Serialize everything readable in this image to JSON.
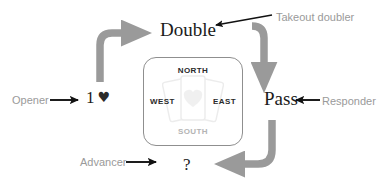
{
  "diagram": {
    "colors": {
      "flow_arrow": "#9a9a9a",
      "pointer_arrow": "#111111",
      "role_label": "#9a9a9a",
      "call_text": "#1b1b1b",
      "compass_border": "#8f8f8f",
      "south_label": "#b4b4b4",
      "background": "#ffffff"
    }
  },
  "calls": {
    "opener_bid": "1",
    "opener_suit": "♥",
    "double": "Double",
    "pass": "Pass",
    "advancer_bid": "?"
  },
  "roles": {
    "opener": "Opener",
    "takeout_doubler": "Takeout doubler",
    "responder": "Responder",
    "advancer": "Advancer"
  },
  "compass": {
    "north": "NORTH",
    "south": "SOUTH",
    "west": "WEST",
    "east": "EAST"
  },
  "icons": {
    "heart_suit": "heart-suit-icon",
    "cards_watermark": "playing-cards-watermark-icon",
    "flow_arrow_opener_to_double": "curved-arrow-up-right-icon",
    "flow_arrow_double_to_pass": "curved-arrow-down-icon",
    "flow_arrow_pass_to_advancer": "curved-arrow-down-left-icon",
    "pointer_opener": "arrow-right-icon",
    "pointer_takeout": "arrow-left-down-icon",
    "pointer_responder": "arrow-left-icon",
    "pointer_advancer": "arrow-right-icon"
  }
}
